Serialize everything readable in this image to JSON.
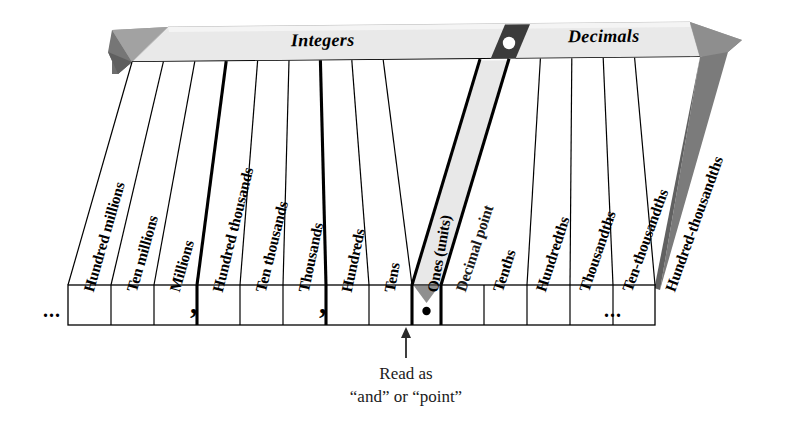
{
  "banner": {
    "left_label": "Integers",
    "right_label": "Decimals",
    "marker_icon": "decimal-point-dot-icon"
  },
  "ellipsis": {
    "left": "...",
    "right": "..."
  },
  "separators": {
    "millions_comma": ",",
    "thousands_comma": ",",
    "decimal_dot": "●"
  },
  "caption": {
    "line1": "Read as",
    "line2": "“and” or “point”",
    "pointer_icon": "up-arrow-icon"
  },
  "colors": {
    "banner_fill": "#e8e8e8",
    "arrow_fill": "#8c8c8c",
    "arrow_shadow": "#6f6f6f",
    "marker_fill": "#3a3a3a",
    "decimal_column_fill": "#e6e6e6",
    "ink": "#000000"
  },
  "columns": [
    {
      "label": "Hundred millions",
      "group": "integers",
      "thick_left": false
    },
    {
      "label": "Ten millions",
      "group": "integers",
      "thick_left": false
    },
    {
      "label": "Millions",
      "group": "integers",
      "thick_left": false
    },
    {
      "label": "Hundred thousands",
      "group": "integers",
      "thick_left": true
    },
    {
      "label": "Ten thousands",
      "group": "integers",
      "thick_left": false
    },
    {
      "label": "Thousands",
      "group": "integers",
      "thick_left": false
    },
    {
      "label": "Hundreds",
      "group": "integers",
      "thick_left": true
    },
    {
      "label": "Tens",
      "group": "integers",
      "thick_left": false
    },
    {
      "label": "Ones (units)",
      "group": "integers",
      "thick_left": false
    },
    {
      "label": "Decimal point",
      "group": "point",
      "thick_left": true
    },
    {
      "label": "Tenths",
      "group": "decimals",
      "thick_left": true
    },
    {
      "label": "Hundredths",
      "group": "decimals",
      "thick_left": false
    },
    {
      "label": "Thousandths",
      "group": "decimals",
      "thick_left": false
    },
    {
      "label": "Ten-thousandths",
      "group": "decimals",
      "thick_left": false
    },
    {
      "label": "Hundred-thousandths",
      "group": "decimals",
      "thick_left": false
    }
  ]
}
